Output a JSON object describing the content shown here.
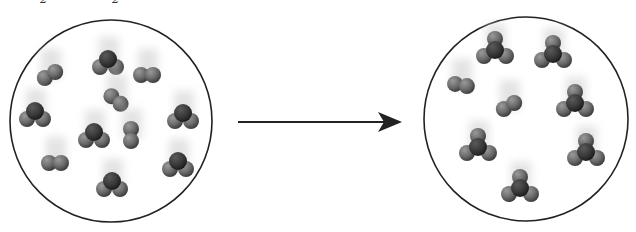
{
  "caption_fragments": [
    {
      "text": "2",
      "x": 40
    },
    {
      "text": "2",
      "x": 112
    }
  ],
  "diagram": {
    "type": "reaction-scheme",
    "arrow": {
      "x1": 238,
      "y1": 122,
      "x2": 398,
      "y2": 122,
      "color": "#222222"
    },
    "colors": {
      "atom_light": "#6b6b6b",
      "atom_dark": "#3a3a3a",
      "outline": "#222222",
      "shadow": "#d8d8d8"
    },
    "reactants": {
      "label": "reactants",
      "circle": {
        "cx": 111,
        "cy": 121,
        "r": 101
      },
      "molecules": [
        {
          "kind": "diatomic",
          "x": 50,
          "y": 75,
          "angle": -30
        },
        {
          "kind": "triatomic",
          "x": 108,
          "y": 63
        },
        {
          "kind": "diatomic",
          "x": 147,
          "y": 75,
          "angle": 0
        },
        {
          "kind": "diatomic",
          "x": 116,
          "y": 100,
          "angle": 40
        },
        {
          "kind": "triatomic",
          "x": 35,
          "y": 115
        },
        {
          "kind": "triatomic",
          "x": 183,
          "y": 117
        },
        {
          "kind": "triatomic",
          "x": 94,
          "y": 136
        },
        {
          "kind": "diatomic",
          "x": 131,
          "y": 135,
          "angle": 90
        },
        {
          "kind": "diatomic",
          "x": 55,
          "y": 163,
          "angle": 0
        },
        {
          "kind": "triatomic",
          "x": 112,
          "y": 185
        },
        {
          "kind": "triatomic",
          "x": 178,
          "y": 165
        }
      ]
    },
    "products": {
      "label": "products",
      "circle": {
        "cx": 526,
        "cy": 119,
        "r": 102
      },
      "molecules": [
        {
          "kind": "tetra",
          "x": 495,
          "y": 50
        },
        {
          "kind": "tetra",
          "x": 553,
          "y": 54
        },
        {
          "kind": "diatomic",
          "x": 461,
          "y": 85,
          "angle": 10
        },
        {
          "kind": "diatomic",
          "x": 509,
          "y": 106,
          "angle": -30
        },
        {
          "kind": "tetra",
          "x": 575,
          "y": 103
        },
        {
          "kind": "tetra",
          "x": 478,
          "y": 147
        },
        {
          "kind": "tetra",
          "x": 586,
          "y": 152
        },
        {
          "kind": "tetra",
          "x": 520,
          "y": 188
        }
      ]
    }
  }
}
